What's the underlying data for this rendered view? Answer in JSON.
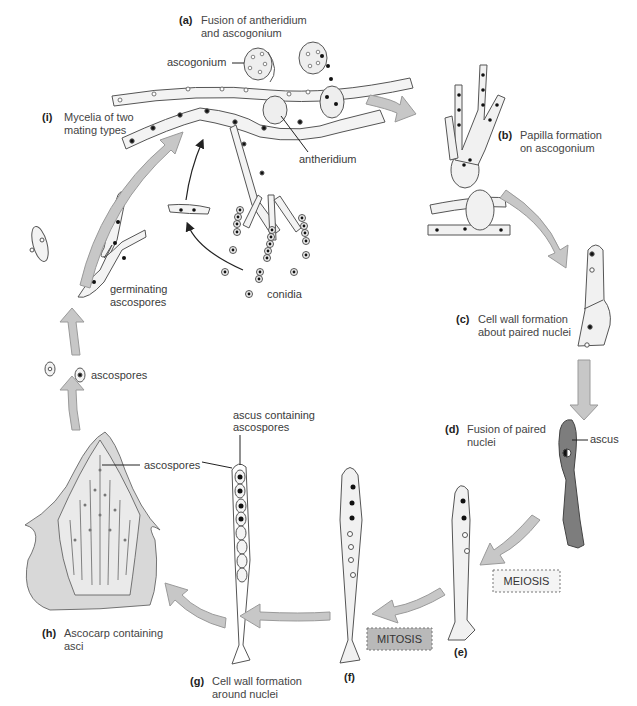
{
  "title": "Ascomycete life cycle",
  "colors": {
    "arrow_fill": "#c7c7c7",
    "arrow_stroke": "#9a9a9a",
    "cell_fill": "#f1f1f1",
    "ascus_dark": "#7d7d7d",
    "outline": "#555555",
    "meiosis_fill": "#f4f4f4",
    "mitosis_fill": "#b9b9b9"
  },
  "steps": [
    {
      "key": "(a)",
      "line1": "Fusion of antheridium",
      "line2": "and ascogonium"
    },
    {
      "key": "(b)",
      "line1": "Papilla formation",
      "line2": "on ascogonium"
    },
    {
      "key": "(c)",
      "line1": "Cell wall formation",
      "line2": "about paired nuclei"
    },
    {
      "key": "(d)",
      "line1": "Fusion of paired",
      "line2": "nuclei"
    },
    {
      "key": "(e)",
      "line1": "",
      "line2": ""
    },
    {
      "key": "(f)",
      "line1": "",
      "line2": ""
    },
    {
      "key": "(g)",
      "line1": "Cell wall formation",
      "line2": "around nuclei"
    },
    {
      "key": "(h)",
      "line1": "Ascocarp containing",
      "line2": "asci"
    },
    {
      "key": "(i)",
      "line1": "Mycelia of two",
      "line2": "mating types"
    }
  ],
  "labels": {
    "ascogonium": "ascogonium",
    "antheridium": "antheridium",
    "conidia": "conidia",
    "germinating1": "germinating",
    "germinating2": "ascospores",
    "ascospores_free": "ascospores",
    "ascus": "ascus",
    "ascus_containing1": "ascus containing",
    "ascus_containing2": "ascospores",
    "ascospores_in_ascocarp": "ascospores"
  },
  "process_boxes": {
    "meiosis": "MEIOSIS",
    "mitosis": "MITOSIS"
  }
}
